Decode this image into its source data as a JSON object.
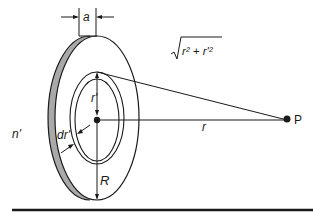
{
  "diagram": {
    "labels": {
      "thickness": "a",
      "ring_radius": "r'",
      "ring_width": "dr'",
      "disk_radius": "R",
      "density": "n'",
      "axial_distance": "r",
      "slant_distance": "√(r² + r'²)",
      "slant_sqrt": "√",
      "slant_inner": "r² + r'²",
      "point": "P"
    },
    "colors": {
      "line": "#1a1a1a",
      "rim_fill": "#a9a9a9",
      "background": "#ffffff"
    }
  }
}
